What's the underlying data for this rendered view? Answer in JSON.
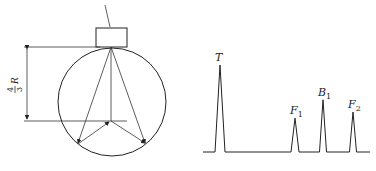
{
  "diagram": {
    "left_figure": {
      "dimension_label": {
        "numerator": "4",
        "denominator": "3",
        "variable": "R"
      },
      "shapes": [
        "probe-block",
        "sphere-circle",
        "reflection-rays",
        "dimension-lines"
      ]
    },
    "right_figure": {
      "type": "echo-waveform",
      "peaks": [
        {
          "label": "T",
          "sub": "",
          "relative_height": 1.0
        },
        {
          "label": "F",
          "sub": "1",
          "relative_height": 0.39
        },
        {
          "label": "B",
          "sub": "1",
          "relative_height": 0.6
        },
        {
          "label": "F",
          "sub": "2",
          "relative_height": 0.46
        }
      ]
    }
  }
}
